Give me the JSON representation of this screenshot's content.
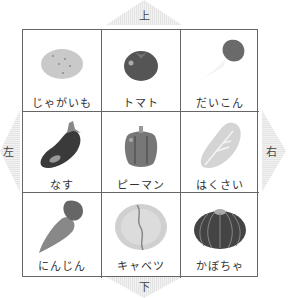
{
  "directions": {
    "up": "上",
    "down": "下",
    "left": "左",
    "right": "右"
  },
  "grid": {
    "cells": [
      {
        "label": "じゃがいも",
        "icon": "potato-icon"
      },
      {
        "label": "トマト",
        "icon": "tomato-icon"
      },
      {
        "label": "だいこん",
        "icon": "daikon-icon"
      },
      {
        "label": "なす",
        "icon": "eggplant-icon"
      },
      {
        "label": "ピーマン",
        "icon": "green-pepper-icon"
      },
      {
        "label": "はくさい",
        "icon": "napa-cabbage-icon"
      },
      {
        "label": "にんじん",
        "icon": "carrot-icon"
      },
      {
        "label": "キャベツ",
        "icon": "cabbage-icon"
      },
      {
        "label": "かぼちゃ",
        "icon": "pumpkin-icon"
      }
    ]
  }
}
